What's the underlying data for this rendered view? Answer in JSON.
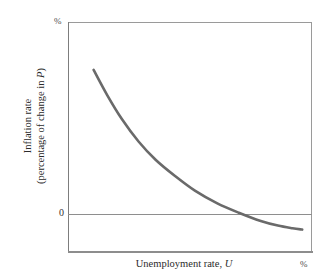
{
  "figure": {
    "background_color": "#ffffff",
    "curve_color": "#6a6a6a",
    "axis_color": "#8d8d8d",
    "text_color": "#2b2b2b"
  },
  "axes": {
    "y_percent_mark": "%",
    "x_percent_mark": "%",
    "zero_tick_label": "0",
    "y_title_line1": "Inflation rate",
    "y_title_line2_prefix": "(percentage of change in ",
    "y_title_line2_symbol": "P",
    "y_title_line2_suffix": ")",
    "x_title_prefix": "Unemployment rate, ",
    "x_title_symbol": "U"
  },
  "chart_data": {
    "type": "line",
    "title": "",
    "subtitle": "",
    "xlabel": "Unemployment rate, U",
    "ylabel": "Inflation rate (percentage of change in P)",
    "x_unit": "%",
    "y_unit": "%",
    "grid": false,
    "legend": null,
    "xlim": [
      0,
      10
    ],
    "ylim": [
      -2,
      10
    ],
    "y_ticks": [
      0
    ],
    "y_tick_labels": [
      "0"
    ],
    "x_ticks": [],
    "x_tick_labels": [],
    "reference_lines": [
      {
        "axis": "y",
        "value": 0,
        "label": "0",
        "color": "#8e8e8e"
      }
    ],
    "series": [
      {
        "name": "Phillips curve",
        "color": "#6a6a6a",
        "width": 2.6,
        "x": [
          1.05,
          1.6,
          2.2,
          2.9,
          3.6,
          4.4,
          5.2,
          6.1,
          7.0,
          7.9,
          8.6,
          9.2,
          9.6
        ],
        "y": [
          7.5,
          6.2,
          4.95,
          3.75,
          2.8,
          1.95,
          1.2,
          0.55,
          0.05,
          -0.38,
          -0.62,
          -0.76,
          -0.83
        ]
      }
    ],
    "annotations": [
      {
        "text": "%",
        "position": "y-axis-top"
      },
      {
        "text": "%",
        "position": "x-axis-right"
      }
    ]
  }
}
